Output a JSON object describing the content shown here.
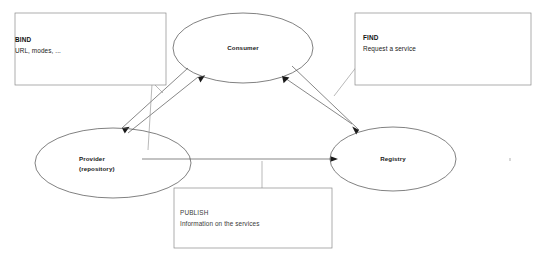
{
  "diagram": {
    "background_color": "#ffffff",
    "shape_stroke_color": "#4a4a4a",
    "box_stroke_color": "#8a8a8a",
    "connector_color": "#555555",
    "text_color": "#1a1a1a",
    "nodes": [
      {
        "id": "consumer",
        "kind": "ellipse",
        "label_line1": "Consumer",
        "label_line2": "",
        "cx": 243,
        "cy": 48,
        "rx": 70,
        "ry": 35
      },
      {
        "id": "provider",
        "kind": "ellipse",
        "label_line1": "Provider",
        "label_line2": "(repository)",
        "cx": 113,
        "cy": 163,
        "rx": 78,
        "ry": 35
      },
      {
        "id": "registry",
        "kind": "ellipse",
        "label_line1": "Registry",
        "label_line2": "",
        "cx": 393,
        "cy": 159,
        "rx": 63,
        "ry": 32
      }
    ],
    "annotations": [
      {
        "id": "bind",
        "title": "BIND",
        "subtitle": "URL, modes, ...",
        "title_bold": true,
        "x": 15,
        "y": 13,
        "width": 151,
        "height": 72
      },
      {
        "id": "find",
        "title": "FIND",
        "subtitle": "Request a service",
        "title_bold": true,
        "x": 355,
        "y": 13,
        "width": 176,
        "height": 72
      },
      {
        "id": "publish",
        "title": "PUBLISH",
        "subtitle": "Information on the services",
        "title_bold": false,
        "x": 174,
        "y": 188,
        "width": 158,
        "height": 60
      }
    ],
    "connectors": [
      {
        "id": "bind-link",
        "from": "provider",
        "to": "consumer",
        "label_ref": "bind",
        "direction": "bidirectional"
      },
      {
        "id": "find-link",
        "from": "consumer",
        "to": "registry",
        "label_ref": "find",
        "direction": "bidirectional"
      },
      {
        "id": "publish-link",
        "from": "provider",
        "to": "registry",
        "label_ref": "publish",
        "direction": "forward"
      }
    ]
  }
}
